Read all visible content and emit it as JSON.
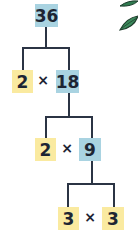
{
  "diagram": {
    "root": {
      "value": "36",
      "color": "#a9d3e1"
    },
    "levels": [
      {
        "left": {
          "value": "2",
          "color": "#faeaa0"
        },
        "operator": "×",
        "right": {
          "value": "18",
          "color": "#a9d3e1"
        }
      },
      {
        "left": {
          "value": "2",
          "color": "#faeaa0"
        },
        "operator": "×",
        "right": {
          "value": "9",
          "color": "#a9d3e1"
        }
      },
      {
        "left": {
          "value": "3",
          "color": "#faeaa0"
        },
        "operator": "×",
        "right": {
          "value": "3",
          "color": "#faeaa0"
        }
      }
    ],
    "line_color": "#2b3444",
    "decoration": "leaf-graphic"
  }
}
